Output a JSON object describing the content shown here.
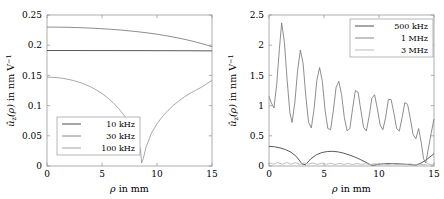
{
  "figure": {
    "panels": [
      {
        "id": "left",
        "name": "low-frequency-panel",
        "chart_data": {
          "type": "line",
          "title": "",
          "xlabel": "ρ in mm",
          "ylabel": "û_z(ρ) in nm V⁻¹",
          "xlabel_parts": {
            "symbol": "ρ",
            "rest": "in mm"
          },
          "ylabel_parts": {
            "u": "û",
            "sub": "z",
            "arg": "(ρ)",
            "rest": "in nm V",
            "exp": "−1"
          },
          "xlim": [
            0,
            15
          ],
          "ylim": [
            0,
            0.25
          ],
          "xticks": [
            0,
            5,
            10,
            15
          ],
          "xticklabels": [
            "0",
            "5",
            "10",
            "15"
          ],
          "yticks": [
            0,
            0.05,
            0.1,
            0.15,
            0.2,
            0.25
          ],
          "yticklabels": [
            "0",
            "0.05",
            "0.1",
            "0.15",
            "0.2",
            "0.25"
          ],
          "grid": false,
          "legend_position": "lower-left",
          "series": [
            {
              "name": "10 kHz",
              "color": "#3b3b3b",
              "x": [
                0,
                1,
                2,
                3,
                4,
                5,
                6,
                7,
                8,
                9,
                10,
                11,
                12,
                13,
                14,
                15
              ],
              "values": [
                0.1912,
                0.1912,
                0.1912,
                0.1912,
                0.1911,
                0.1911,
                0.1911,
                0.191,
                0.191,
                0.191,
                0.1909,
                0.1909,
                0.1908,
                0.1908,
                0.1907,
                0.1906
              ]
            },
            {
              "name": "30 kHz",
              "color": "#7a7a7a",
              "x": [
                0,
                1,
                2,
                3,
                4,
                5,
                6,
                7,
                8,
                9,
                10,
                11,
                12,
                13,
                14,
                15
              ],
              "values": [
                0.23,
                0.2299,
                0.2296,
                0.229,
                0.2283,
                0.2273,
                0.2261,
                0.2246,
                0.2228,
                0.2207,
                0.2182,
                0.2152,
                0.2117,
                0.2077,
                0.203,
                0.1975
              ]
            },
            {
              "name": "100 kHz",
              "color": "#9a9a9a",
              "x": [
                0,
                0.5,
                1,
                1.5,
                2,
                2.5,
                3,
                3.5,
                4,
                4.5,
                5,
                5.5,
                6,
                6.5,
                7,
                7.5,
                8,
                8.25,
                8.5,
                8.6,
                8.75,
                9,
                9.5,
                10,
                10.5,
                11,
                11.5,
                12,
                12.5,
                13,
                13.5,
                14,
                14.5,
                15
              ],
              "values": [
                0.147,
                0.1468,
                0.1461,
                0.1449,
                0.1432,
                0.141,
                0.1382,
                0.1348,
                0.1307,
                0.1258,
                0.12,
                0.1131,
                0.105,
                0.0954,
                0.084,
                0.0703,
                0.053,
                0.042,
                0.027,
                0.005,
                0.012,
                0.031,
                0.0545,
                0.07,
                0.082,
                0.092,
                0.1005,
                0.108,
                0.1145,
                0.1202,
                0.1253,
                0.13,
                0.136,
                0.142
              ]
            }
          ]
        }
      },
      {
        "id": "right",
        "name": "high-frequency-panel",
        "chart_data": {
          "type": "line",
          "title": "",
          "xlabel": "ρ in mm",
          "ylabel": "û_z(ρ) in nm V⁻¹",
          "xlabel_parts": {
            "symbol": "ρ",
            "rest": "in mm"
          },
          "ylabel_parts": {
            "u": "û",
            "sub": "z",
            "arg": "(ρ)",
            "rest": "in nm V",
            "exp": "−1"
          },
          "xlim": [
            0,
            15
          ],
          "ylim": [
            0,
            2.5
          ],
          "xticks": [
            0,
            5,
            10,
            15
          ],
          "xticklabels": [
            "0",
            "5",
            "10",
            "15"
          ],
          "yticks": [
            0,
            0.5,
            1,
            1.5,
            2,
            2.5
          ],
          "yticklabels": [
            "0",
            "0.5",
            "1",
            "1.5",
            "2",
            "2.5"
          ],
          "grid": false,
          "legend_position": "upper-right",
          "series": [
            {
              "name": "500 kHz",
              "color": "#3b3b3b",
              "x": [
                0,
                0.5,
                1,
                1.5,
                2,
                2.5,
                3,
                3.3,
                3.8,
                4.3,
                4.8,
                5.3,
                5.8,
                6.3,
                6.8,
                7.3,
                7.8,
                8.3,
                8.8,
                9.2,
                9.5,
                10,
                10.5,
                11,
                11.5,
                12,
                12.5,
                13,
                13.4,
                13.8,
                14.2,
                14.6,
                15
              ],
              "values": [
                0.325,
                0.318,
                0.3,
                0.272,
                0.228,
                0.155,
                0.035,
                0.02,
                0.118,
                0.185,
                0.222,
                0.24,
                0.243,
                0.233,
                0.212,
                0.183,
                0.148,
                0.108,
                0.062,
                0.022,
                0.012,
                0.03,
                0.038,
                0.04,
                0.038,
                0.034,
                0.028,
                0.02,
                0.018,
                0.045,
                0.09,
                0.145,
                0.205
              ]
            },
            {
              "name": "1 MHz",
              "color": "#7a7a7a",
              "x": [
                0,
                0.2,
                0.45,
                0.7,
                0.95,
                1.15,
                1.4,
                1.65,
                1.9,
                2.1,
                2.35,
                2.6,
                2.85,
                3.1,
                3.35,
                3.6,
                3.85,
                4.1,
                4.35,
                4.6,
                4.85,
                5.1,
                5.35,
                5.6,
                5.85,
                6.1,
                6.35,
                6.6,
                6.85,
                7.1,
                7.35,
                7.6,
                7.85,
                8.1,
                8.35,
                8.6,
                8.85,
                9.1,
                9.35,
                9.6,
                9.85,
                10.1,
                10.35,
                10.6,
                10.85,
                11.1,
                11.35,
                11.6,
                11.85,
                12.1,
                12.35,
                12.6,
                12.85,
                13.1,
                13.35,
                13.6,
                13.85,
                14.05,
                14.25,
                14.5,
                14.75,
                15
              ],
              "values": [
                1.15,
                1.05,
                0.96,
                1.35,
                1.95,
                2.37,
                2.05,
                1.42,
                0.88,
                0.72,
                1.05,
                1.58,
                1.92,
                1.7,
                1.15,
                0.72,
                0.63,
                0.95,
                1.42,
                1.63,
                1.4,
                0.92,
                0.62,
                0.6,
                0.92,
                1.3,
                1.4,
                1.18,
                0.8,
                0.58,
                0.62,
                0.95,
                1.25,
                1.22,
                0.92,
                0.64,
                0.58,
                0.82,
                1.12,
                1.18,
                0.95,
                0.68,
                0.6,
                0.8,
                1.1,
                1.1,
                0.88,
                0.62,
                0.58,
                0.8,
                1.05,
                1.02,
                0.78,
                0.52,
                0.45,
                0.62,
                0.38,
                0.12,
                0.05,
                0.3,
                0.55,
                0.78
              ]
            },
            {
              "name": "3 MHz",
              "color": "#b4b4b4",
              "x": [
                0,
                0.4,
                0.8,
                1.2,
                1.6,
                2,
                2.4,
                2.8,
                3.2,
                3.6,
                4,
                4.4,
                4.8,
                5.2,
                5.6,
                6,
                6.4,
                6.8,
                7.2,
                7.6,
                8,
                8.4,
                8.8,
                9.2,
                9.6,
                10,
                10.4,
                10.8,
                11.2,
                11.6,
                12,
                12.4,
                12.8,
                13.2,
                13.6,
                14,
                14.4,
                14.8,
                15
              ],
              "values": [
                0.055,
                0.03,
                0.06,
                0.028,
                0.058,
                0.03,
                0.055,
                0.027,
                0.052,
                0.03,
                0.05,
                0.026,
                0.048,
                0.028,
                0.046,
                0.025,
                0.045,
                0.027,
                0.043,
                0.024,
                0.042,
                0.026,
                0.04,
                0.023,
                0.039,
                0.025,
                0.038,
                0.022,
                0.037,
                0.024,
                0.036,
                0.022,
                0.035,
                0.023,
                0.034,
                0.021,
                0.033,
                0.022,
                0.032
              ]
            }
          ]
        }
      }
    ]
  }
}
